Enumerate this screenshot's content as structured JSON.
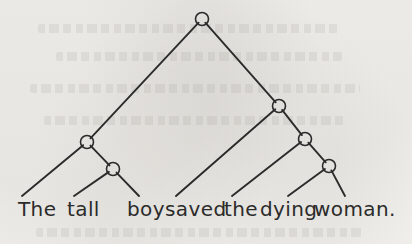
{
  "figure": {
    "kind": "syntax-tree-diagram",
    "caption_text": "The tall boy saved the dying woman.",
    "background_color": "#f2f1ee",
    "ink_color": "#2b2b2b"
  },
  "sentence": {
    "text": "The tall boy saved the dying woman.",
    "words": [
      {
        "id": "w1",
        "text": "The",
        "x": 18,
        "leaf_x": 22
      },
      {
        "id": "w2",
        "text": "tall",
        "x": 67,
        "leaf_x": 74
      },
      {
        "id": "w3",
        "text": "boy",
        "x": 127,
        "leaf_x": 139
      },
      {
        "id": "w4",
        "text": "saved",
        "x": 165,
        "leaf_x": 176
      },
      {
        "id": "w5",
        "text": "the",
        "x": 224,
        "leaf_x": 232
      },
      {
        "id": "w6",
        "text": "dying",
        "x": 260,
        "leaf_x": 288
      },
      {
        "id": "w7",
        "text": "woman.",
        "x": 314,
        "leaf_x": 345
      }
    ]
  },
  "tree": {
    "node_radius": 6.5,
    "node_stroke_width": 1.6,
    "edge_stroke_width": 1.9,
    "leaf_y": 196,
    "nodes": [
      {
        "id": "n-root",
        "label": "root",
        "x": 202,
        "y": 19
      },
      {
        "id": "n-np1",
        "label": "left-branch",
        "x": 87,
        "y": 142
      },
      {
        "id": "n-np1a",
        "label": "left-sub",
        "x": 113,
        "y": 169
      },
      {
        "id": "n-vp",
        "label": "right-branch",
        "x": 279,
        "y": 106
      },
      {
        "id": "n-np2",
        "label": "right-sub",
        "x": 305,
        "y": 139
      },
      {
        "id": "n-np2a",
        "label": "right-sub-lower",
        "x": 329,
        "y": 166
      }
    ],
    "edges": [
      {
        "id": "e1",
        "from": "n-root",
        "to": "n-np1"
      },
      {
        "id": "e2",
        "from": "n-root",
        "to": "n-vp"
      },
      {
        "id": "e3",
        "from": "n-np1",
        "to": "w1"
      },
      {
        "id": "e4",
        "from": "n-np1",
        "to": "n-np1a"
      },
      {
        "id": "e5",
        "from": "n-np1a",
        "to": "w2"
      },
      {
        "id": "e6",
        "from": "n-np1a",
        "to": "w3"
      },
      {
        "id": "e7",
        "from": "n-vp",
        "to": "w4"
      },
      {
        "id": "e8",
        "from": "n-vp",
        "to": "n-np2"
      },
      {
        "id": "e9",
        "from": "n-np2",
        "to": "w5"
      },
      {
        "id": "e10",
        "from": "n-np2",
        "to": "n-np2a"
      },
      {
        "id": "e11",
        "from": "n-np2a",
        "to": "w6"
      },
      {
        "id": "e12",
        "from": "n-np2a",
        "to": "w7"
      }
    ]
  },
  "showthrough_lines": [
    {
      "x": 38,
      "y": 24,
      "w": 300
    },
    {
      "x": 56,
      "y": 52,
      "w": 286
    },
    {
      "x": 30,
      "y": 84,
      "w": 330
    },
    {
      "x": 44,
      "y": 116,
      "w": 304
    },
    {
      "x": 36,
      "y": 228,
      "w": 326
    }
  ]
}
